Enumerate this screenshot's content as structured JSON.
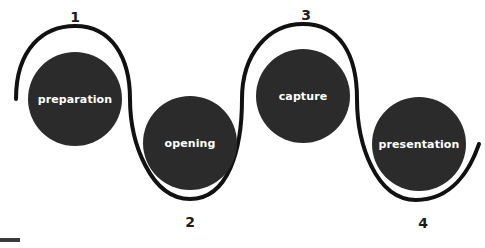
{
  "diagram": {
    "type": "process-flow-serpentine",
    "title": "",
    "canvas": {
      "width": 485,
      "height": 248
    },
    "colors": {
      "background": "#ffffff",
      "node_fill": "#2b2b2b",
      "node_label": "#ffffff",
      "path_stroke": "#111111",
      "path_halo": "#ffffff",
      "step_number": "#1c1c1c",
      "corner_mark": "#3a3a3a"
    },
    "path": {
      "stroke_width": 4,
      "halo_width": 13,
      "shape": "s-curve-wave",
      "d": "M 16 99 C 16 48 44 26 75 26 C 112 26 130 58 130 99 C 130 143 151 199 190 199 C 229 199 242 148 242 99 C 242 54 268 24 303 24 C 340 24 357 55 357 99 C 357 144 376 200 416 200 C 452 200 470 170 479 144"
    },
    "nodes": [
      {
        "id": "node-1",
        "label": "preparation",
        "step": "1",
        "cx": 75,
        "cy": 99,
        "r": 47,
        "step_x": 75,
        "step_y": 17,
        "step_position": "above"
      },
      {
        "id": "node-2",
        "label": "opening",
        "step": "2",
        "cx": 190,
        "cy": 143,
        "r": 47,
        "step_x": 190,
        "step_y": 222,
        "step_position": "below"
      },
      {
        "id": "node-3",
        "label": "capture",
        "step": "3",
        "cx": 303,
        "cy": 96,
        "r": 47,
        "step_x": 306,
        "step_y": 15,
        "step_position": "above"
      },
      {
        "id": "node-4",
        "label": "presentation",
        "step": "4",
        "cx": 419,
        "cy": 144,
        "r": 47,
        "step_x": 423,
        "step_y": 223,
        "step_position": "below"
      }
    ],
    "corner_mark": {
      "x": 0,
      "y": 238,
      "width": 20,
      "height": 4
    }
  }
}
